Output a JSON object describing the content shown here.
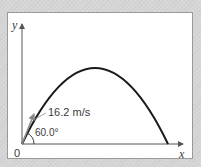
{
  "diagram": {
    "type": "projectile-trajectory",
    "axes": {
      "x_label": "x",
      "y_label": "y",
      "origin_label": "0"
    },
    "launch": {
      "speed_label": "16.2  m/s",
      "angle_label": "60.0°",
      "speed_value": 16.2,
      "speed_unit": "m/s",
      "angle_deg": 60.0
    },
    "colors": {
      "background": "#d6d6d6",
      "frame": "#ffffff",
      "frame_border": "#9a9a9a",
      "axes": "#555555",
      "trajectory": "#1a1a1a",
      "velocity_arrow": "#8a8a8a",
      "text": "#3a3a3a"
    }
  }
}
